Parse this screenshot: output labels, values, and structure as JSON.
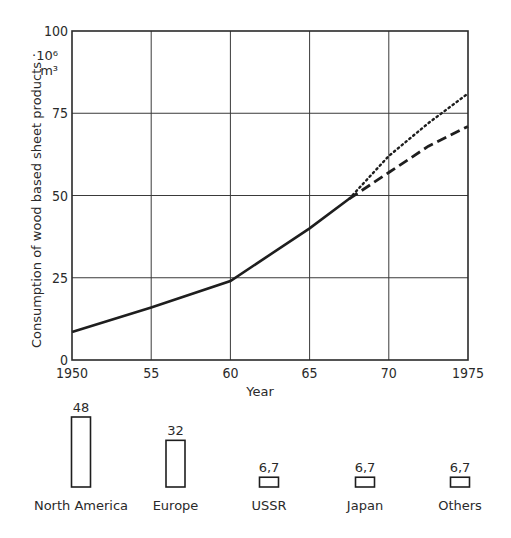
{
  "chart_data": [
    {
      "type": "line",
      "title": "",
      "xlabel": "Year",
      "ylabel": "Consumption of wood based sheet products",
      "yunit_line1": "·10⁶",
      "yunit_line2": "m³",
      "xlim": [
        1950,
        1975
      ],
      "ylim": [
        0,
        100
      ],
      "grid": true,
      "x_ticks": [
        {
          "value": 1950,
          "label": "1950"
        },
        {
          "value": 1955,
          "label": "55"
        },
        {
          "value": 1960,
          "label": "60"
        },
        {
          "value": 1965,
          "label": "65"
        },
        {
          "value": 1970,
          "label": "70"
        },
        {
          "value": 1975,
          "label": "1975"
        }
      ],
      "y_ticks": [
        {
          "value": 0,
          "label": "0"
        },
        {
          "value": 25,
          "label": "25"
        },
        {
          "value": 50,
          "label": "50"
        },
        {
          "value": 75,
          "label": "75"
        },
        {
          "value": 100,
          "label": "100"
        }
      ],
      "series": [
        {
          "name": "actual",
          "style": "solid",
          "x": [
            1950,
            1955,
            1960,
            1965,
            1967.5
          ],
          "y": [
            8.5,
            16,
            24,
            40,
            49
          ]
        },
        {
          "name": "forecast-high",
          "style": "dotted",
          "x": [
            1967.5,
            1970,
            1972.5,
            1975
          ],
          "y": [
            49,
            62,
            72,
            81
          ]
        },
        {
          "name": "forecast-low",
          "style": "dashed",
          "x": [
            1967.5,
            1970,
            1972.5,
            1975
          ],
          "y": [
            49,
            57,
            65,
            71
          ]
        }
      ]
    },
    {
      "type": "bar",
      "title": "",
      "categories": [
        "North America",
        "Europe",
        "USSR",
        "Japan",
        "Others"
      ],
      "values": [
        48,
        32,
        6.7,
        6.7,
        6.7
      ],
      "value_labels": [
        "48",
        "32",
        "6,7",
        "6,7",
        "6,7"
      ]
    }
  ]
}
